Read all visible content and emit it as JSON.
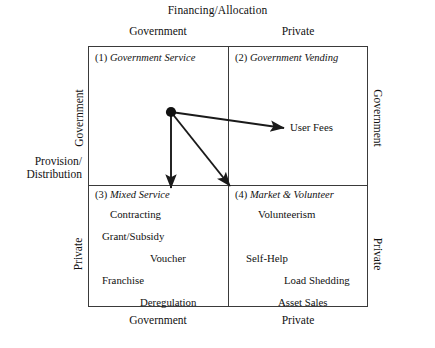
{
  "figure": {
    "title": "Financing/Allocation",
    "left_axis_caption": "Provision/\nDistribution",
    "left_axis_caption_line1": "Provision/",
    "left_axis_caption_line2": "Distribution"
  },
  "axes": {
    "top": {
      "label": "Financing/Allocation",
      "columns": [
        "Government",
        "Private"
      ]
    },
    "bottom": {
      "columns": [
        "Government",
        "Private"
      ]
    },
    "left": {
      "label_line1": "Provision/",
      "label_line2": "Distribution",
      "rows": [
        "Government",
        "Private"
      ]
    },
    "right": {
      "rows": [
        "Government",
        "Private"
      ]
    }
  },
  "quadrants": [
    {
      "number": "(1)",
      "name": "Government Service",
      "items": []
    },
    {
      "number": "(2)",
      "name": "Government Vending",
      "items": []
    },
    {
      "number": "(3)",
      "name": "Mixed Service",
      "items": [
        "Contracting",
        "Grant/Subsidy",
        "Voucher",
        "Franchise",
        "Deregulation"
      ]
    },
    {
      "number": "(4)",
      "name": "Market & Volunteer",
      "items": [
        "Volunteerism",
        "Self-Help",
        "Load Shedding",
        "Asset Sales"
      ]
    }
  ],
  "annotations": {
    "user_fees_label": "User Fees",
    "origin_marker": "filled-dot"
  },
  "colors": {
    "background": "#ffffff",
    "line": "#3a3a3a",
    "arrow": "#1a1a1a",
    "text": "#111111"
  }
}
